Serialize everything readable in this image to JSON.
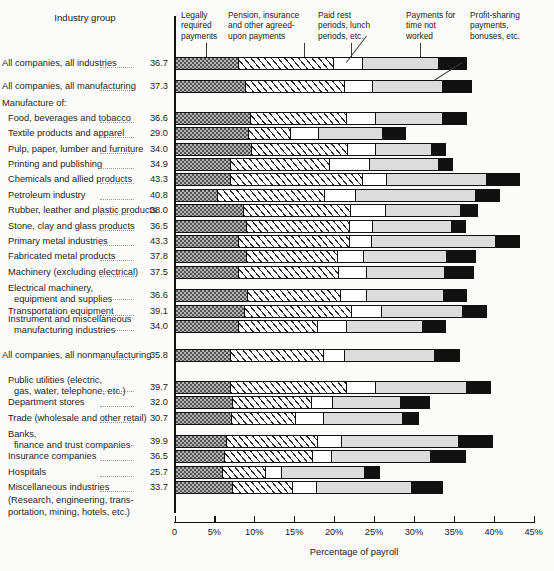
{
  "header": {
    "row_header": "Industry group",
    "axis_title": "Percentage of payroll"
  },
  "legend": [
    {
      "id": "legally-required",
      "lines": [
        "Legally",
        "required",
        "payments"
      ]
    },
    {
      "id": "pension-insurance",
      "lines": [
        "Pension, insurance",
        "and other agreed-",
        "upon payments"
      ]
    },
    {
      "id": "paid-rest",
      "lines": [
        "Paid rest",
        "periods, lunch",
        "periods, etc."
      ]
    },
    {
      "id": "time-not-worked",
      "lines": [
        "Payments for",
        "time not",
        "worked"
      ]
    },
    {
      "id": "profit-sharing",
      "lines": [
        "Profit-sharing",
        "payments,",
        "bonuses, etc."
      ]
    }
  ],
  "axis": {
    "ticks": [
      "0",
      "5%",
      "10%",
      "15%",
      "20%",
      "25%",
      "30%",
      "35%",
      "40%",
      "45%"
    ],
    "min": 0,
    "max": 45
  },
  "group_headings": [
    {
      "text": "Manufacture of:"
    },
    {
      "text": "Instrument and miscellaneous"
    },
    {
      "text": "(Research, engineering, trans-"
    },
    {
      "text": "portation, mining, hotels, etc.)"
    }
  ],
  "chart_data": {
    "type": "bar",
    "orientation": "horizontal",
    "stacked": true,
    "title": "",
    "xlabel": "Percentage of payroll",
    "ylabel": "Industry group",
    "xlim": [
      0,
      45
    ],
    "grid": false,
    "legend_position": "top",
    "series": [
      {
        "name": "Legally required payments",
        "key": "s0"
      },
      {
        "name": "Pension, insurance and other agreed-upon payments",
        "key": "s1"
      },
      {
        "name": "Paid rest periods, lunch periods, etc.",
        "key": "s2"
      },
      {
        "name": "Payments for time not worked",
        "key": "s3"
      },
      {
        "name": "Profit-sharing payments, bonuses, etc.",
        "key": "s4"
      }
    ],
    "rows": [
      {
        "label": "All companies, all industries",
        "total": "36.7",
        "values": [
          8.0,
          12.0,
          3.6,
          9.6,
          3.5
        ],
        "indent": 0,
        "gap_after": 8
      },
      {
        "label": "All companies, all manufacturing",
        "total": "37.3",
        "values": [
          8.9,
          12.5,
          3.5,
          8.8,
          3.6
        ],
        "indent": 0,
        "gap_after": 14
      },
      {
        "label": "Food, beverages and tobacco",
        "total": "36.6",
        "values": [
          9.5,
          12.2,
          3.6,
          8.5,
          2.8
        ],
        "indent": 1,
        "gap_after": 0
      },
      {
        "label": "Textile products and apparel",
        "total": "29.0",
        "values": [
          9.3,
          5.3,
          3.5,
          8.1,
          2.8
        ],
        "indent": 1,
        "gap_after": 0
      },
      {
        "label": "Pulp, paper, lumber and furniture",
        "total": "34.0",
        "values": [
          9.6,
          12.2,
          3.5,
          7.1,
          1.6
        ],
        "indent": 1,
        "gap_after": 0
      },
      {
        "label": "Printing and publishing",
        "total": "34.9",
        "values": [
          7.0,
          12.5,
          5.1,
          8.7,
          1.6
        ],
        "indent": 1,
        "gap_after": 0
      },
      {
        "label": "Chemicals and allied products",
        "total": "43.3",
        "values": [
          7.0,
          16.6,
          3.1,
          12.5,
          4.1
        ],
        "indent": 1,
        "gap_after": 0
      },
      {
        "label": "Petroleum industry",
        "total": "40.8",
        "values": [
          5.3,
          13.5,
          4.0,
          15.1,
          2.9
        ],
        "indent": 1,
        "gap_after": 0
      },
      {
        "label": "Rubber, leather and plastic products",
        "total": "38.0",
        "values": [
          8.7,
          13.4,
          4.5,
          9.4,
          2.0
        ],
        "indent": 1,
        "gap_after": 0
      },
      {
        "label": "Stone, clay and glass products",
        "total": "36.5",
        "values": [
          9.0,
          13.0,
          2.9,
          10.0,
          1.6
        ],
        "indent": 1,
        "gap_after": 0
      },
      {
        "label": "Primary metal industries",
        "total": "43.3",
        "values": [
          8.0,
          14.0,
          2.8,
          15.6,
          2.9
        ],
        "indent": 1,
        "gap_after": 0
      },
      {
        "label": "Fabricated metal products",
        "total": "37.8",
        "values": [
          9.0,
          11.5,
          3.3,
          10.5,
          3.5
        ],
        "indent": 1,
        "gap_after": 0
      },
      {
        "label": "Machinery (excluding electrical)",
        "total": "37.5",
        "values": [
          8.0,
          12.6,
          3.5,
          9.9,
          3.5
        ],
        "indent": 1,
        "gap_after": 8
      },
      {
        "label": "Electrical machinery, equipment and supplies",
        "total": "36.6",
        "values": [
          9.1,
          11.8,
          3.2,
          9.8,
          2.7
        ],
        "indent": 1,
        "two_line": true,
        "gap_after": 0
      },
      {
        "label": "Transportation equipment",
        "total": "39.1",
        "values": [
          8.8,
          13.4,
          3.9,
          10.2,
          2.8
        ],
        "indent": 1,
        "gap_after": 0
      },
      {
        "label": "Instrument and miscellaneous manufacturing industries",
        "total": "34.0",
        "values": [
          8.0,
          10.0,
          3.6,
          9.6,
          2.8
        ],
        "indent": 1,
        "two_line": true,
        "gap_after": 14
      },
      {
        "label": "All companies, all nonmanufacturing",
        "total": "35.8",
        "values": [
          7.0,
          11.8,
          2.6,
          11.4,
          3.0
        ],
        "indent": 0,
        "gap_after": 16
      },
      {
        "label": "Public utilities (electric, gas, water, telephone, etc.)",
        "total": "39.7",
        "values": [
          7.0,
          14.6,
          3.7,
          11.5,
          2.9
        ],
        "indent": 1,
        "two_line": true,
        "gap_after": 0
      },
      {
        "label": "Department stores",
        "total": "32.0",
        "values": [
          7.2,
          10.0,
          2.7,
          8.6,
          3.5
        ],
        "indent": 1,
        "gap_after": 0
      },
      {
        "label": "Trade (wholesale and other retail)",
        "total": "30.7",
        "values": [
          7.2,
          8.0,
          3.6,
          10.0,
          1.9
        ],
        "indent": 1,
        "gap_after": 8
      },
      {
        "label": "Banks, finance and trust companies",
        "total": "39.9",
        "values": [
          6.5,
          11.5,
          3.0,
          14.8,
          4.1
        ],
        "indent": 1,
        "two_line": true,
        "gap_after": 0
      },
      {
        "label": "Insurance companies",
        "total": "36.5",
        "values": [
          6.3,
          11.0,
          2.5,
          12.5,
          4.2
        ],
        "indent": 1,
        "gap_after": 0
      },
      {
        "label": "Hospitals",
        "total": "25.7",
        "values": [
          6.0,
          5.5,
          2.0,
          10.5,
          1.7
        ],
        "indent": 1,
        "gap_after": 0
      },
      {
        "label": "Miscellaneous industries",
        "total": "33.7",
        "values": [
          7.3,
          7.5,
          3.0,
          12.0,
          3.9
        ],
        "indent": 1,
        "gap_after": 0
      }
    ]
  }
}
